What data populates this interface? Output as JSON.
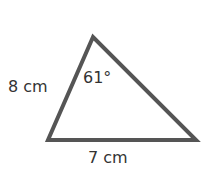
{
  "diagram": {
    "shape": "triangle",
    "stroke_color": "#555555",
    "labels": {
      "left_side": "8 cm",
      "base": "7 cm",
      "apex_angle": "61°"
    }
  }
}
